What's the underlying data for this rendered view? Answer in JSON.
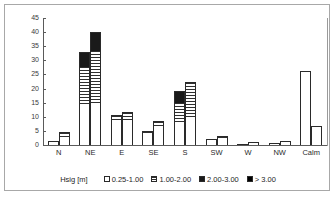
{
  "chart_data": {
    "type": "bar",
    "title": "",
    "subtitle": "",
    "xlabel": "",
    "ylabel": "",
    "ylim": [
      0,
      45
    ],
    "yticks": [
      0,
      5,
      10,
      15,
      20,
      25,
      30,
      35,
      40,
      45
    ],
    "grid": false,
    "legend_position": "bottom",
    "legend_title": "Hsig [m]",
    "stacked": true,
    "bars_per_category": 2,
    "categories": [
      "N",
      "NE",
      "E",
      "SE",
      "S",
      "SW",
      "W",
      "NW",
      "Calm"
    ],
    "series": [
      {
        "name": "0.25-1.00",
        "color": "#ffffff",
        "pattern": "empty",
        "bar1": [
          1.3,
          14.3,
          8.4,
          4.0,
          7.5,
          2.0,
          0.2,
          0.5,
          26.1
        ],
        "bar2": [
          2.8,
          14.9,
          8.3,
          6.0,
          9.2,
          2.6,
          0.8,
          0.9,
          6.7
        ]
      },
      {
        "name": "1.00-2.00",
        "color": "#ffffff",
        "pattern": "horizontal-hatch",
        "bar1": [
          0.3,
          13.2,
          2.0,
          0.9,
          7.3,
          0.3,
          0.1,
          0.3,
          0.0
        ],
        "bar2": [
          1.7,
          18.5,
          3.2,
          2.3,
          12.9,
          0.7,
          0.2,
          0.4,
          0.0
        ]
      },
      {
        "name": "2.00-3.00",
        "color": "#1a1a1a",
        "pattern": "solid-dark",
        "bar1": [
          0.0,
          5.5,
          0.3,
          0.1,
          4.5,
          0.0,
          0.0,
          0.0,
          0.0
        ],
        "bar2": [
          0.1,
          6.6,
          0.2,
          0.2,
          0.4,
          0.0,
          0.0,
          0.0,
          0.0
        ]
      },
      {
        "name": "> 3.00",
        "color": "#000000",
        "pattern": "solid-black",
        "bar1": [
          0.0,
          0.0,
          0.0,
          0.0,
          0.0,
          0.0,
          0.0,
          0.0,
          0.0
        ],
        "bar2": [
          0.0,
          0.0,
          0.0,
          0.0,
          0.0,
          0.0,
          0.0,
          0.0,
          0.0
        ]
      }
    ],
    "totals": {
      "bar1": [
        1.6,
        33.0,
        10.7,
        5.0,
        19.3,
        2.3,
        0.3,
        0.8,
        26.1
      ],
      "bar2": [
        4.6,
        40.0,
        11.7,
        8.5,
        22.5,
        3.3,
        1.0,
        1.3,
        6.7
      ]
    }
  },
  "axis": {
    "ytick_labels": [
      "45",
      "40",
      "35",
      "30",
      "25",
      "20",
      "15",
      "10",
      "5",
      "0"
    ]
  },
  "legend": {
    "title": "Hsig [m]",
    "items": [
      {
        "label": "0.25-1.00",
        "swatch": "c0"
      },
      {
        "label": "1.00-2.00",
        "swatch": "c1"
      },
      {
        "label": "2.00-3.00",
        "swatch": "c2"
      },
      {
        "label": "> 3.00",
        "swatch": "c3"
      }
    ]
  }
}
